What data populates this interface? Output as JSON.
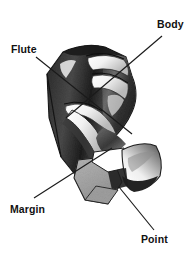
{
  "figure": {
    "background_color": "#ffffff",
    "width": 196,
    "height": 262
  },
  "labels": [
    {
      "id": "flute",
      "text": "Flute",
      "x": 11,
      "y": 44,
      "leader": {
        "x1": 36,
        "y1": 57,
        "x2": 132,
        "y2": 134
      }
    },
    {
      "id": "body",
      "text": "Body",
      "x": 157,
      "y": 19,
      "leader": {
        "x1": 162,
        "y1": 36,
        "x2": 66,
        "y2": 118
      }
    },
    {
      "id": "margin",
      "text": "Margin",
      "x": 10,
      "y": 204,
      "leader": {
        "x1": 34,
        "y1": 198,
        "x2": 112,
        "y2": 148
      }
    },
    {
      "id": "point",
      "text": "Point",
      "x": 141,
      "y": 234,
      "leader": {
        "x1": 154,
        "y1": 230,
        "x2": 119,
        "y2": 187
      }
    }
  ],
  "palette": {
    "ink": "#111111",
    "leader_line": "#1a1a1a",
    "outline": "#1d1d1d",
    "shade_dark": "#272727",
    "shade_mid": "#5e5e5e",
    "shade_light": "#9a9a9a",
    "facet_gray": "#a9a9a9",
    "highlight": "#ffffff",
    "paper": "#ffffff"
  },
  "illustration_parts": [
    {
      "name": "shank-body",
      "description": "upper cylindrical body with helical flutes, heavy cross-hatched shading"
    },
    {
      "name": "flute-groove",
      "description": "spiral groove winding down the body, white highlight along its edge"
    },
    {
      "name": "margin-land",
      "description": "narrow raised strip running along the flute edge"
    },
    {
      "name": "point-facet-left",
      "description": "flat gray lip clearance facet at lower left"
    },
    {
      "name": "point-facet-right",
      "description": "curved fan-shaped flank facet at lower right"
    },
    {
      "name": "cutting-edge",
      "description": "white wedge between the two point facets"
    }
  ]
}
